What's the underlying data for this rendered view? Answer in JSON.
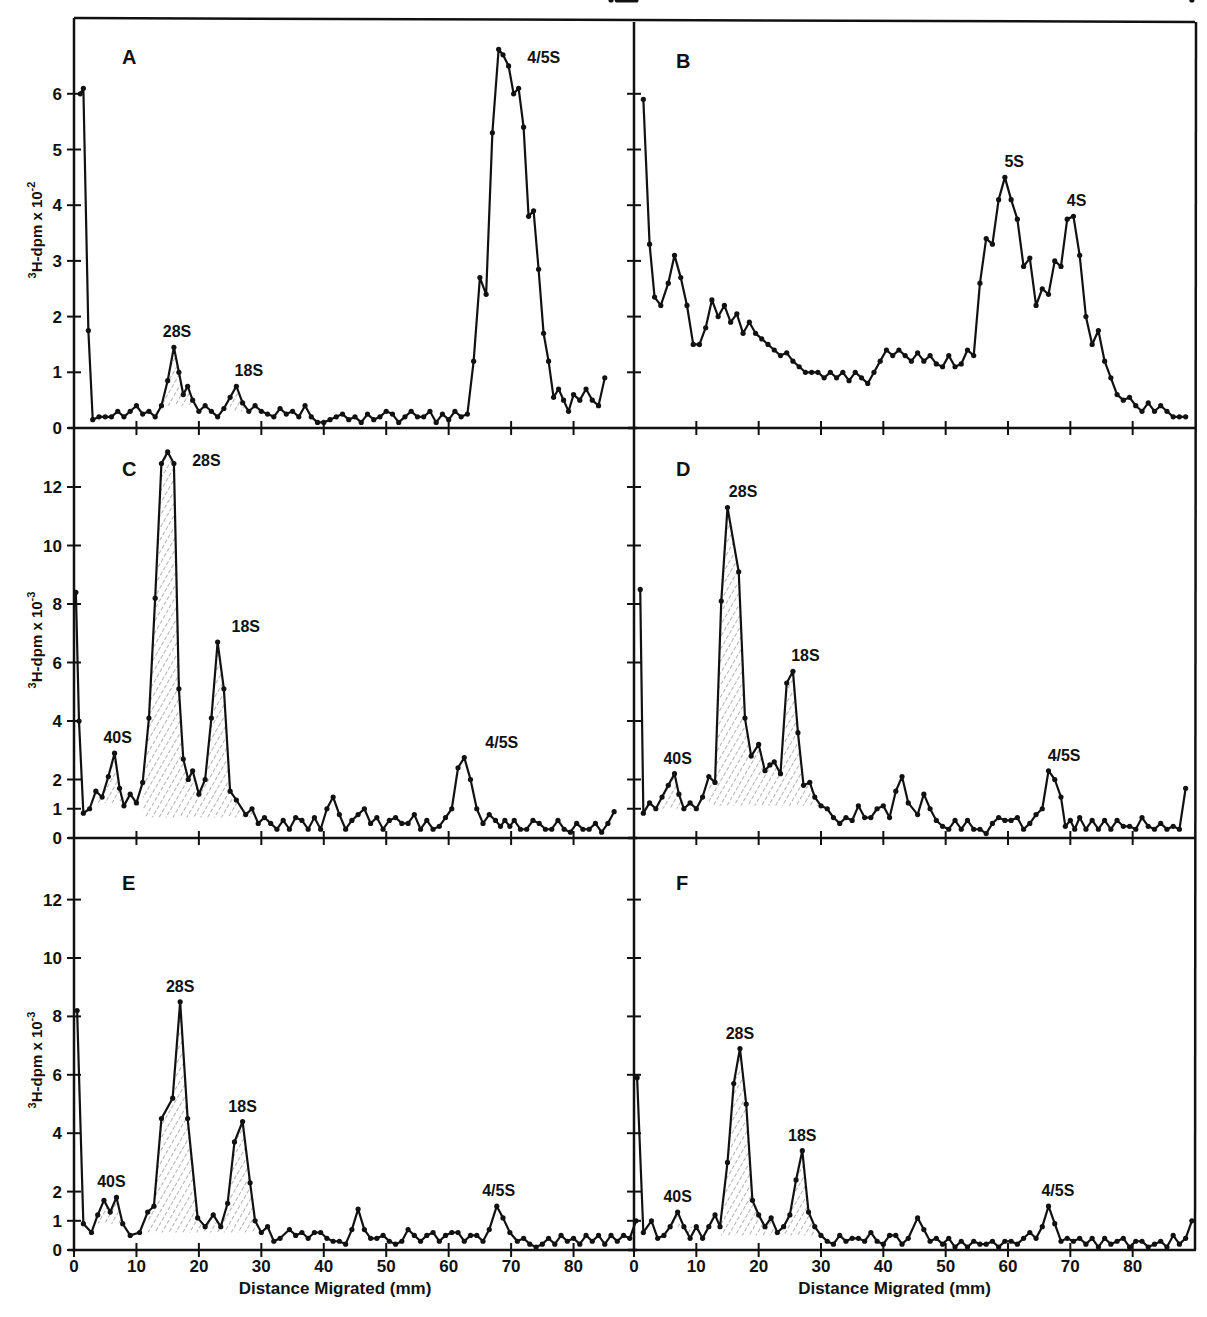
{
  "figure": {
    "x_axis_label": "Distance Migrated (mm)",
    "x_axis_label_right": "Distance Migrated (mm)",
    "y_axis_label_top": "3H-dpm x 10-2",
    "y_axis_label_mid": "3H-dpm x 10-3",
    "y_axis_label_bottom": "3H-dpm x 10-3",
    "x_ticks": [
      0,
      10,
      20,
      30,
      40,
      50,
      60,
      70,
      80
    ],
    "colors": {
      "line": "#111111",
      "hatch": "#555555",
      "background": "#ffffff"
    }
  },
  "chart_data": [
    {
      "panel": "A",
      "type": "line",
      "title": "A",
      "xlabel": "",
      "ylabel": "3H-dpm x 10^-2",
      "xlim": [
        0,
        90
      ],
      "ylim": [
        0,
        7
      ],
      "y_ticks": [
        0,
        1,
        2,
        3,
        4,
        5,
        6
      ],
      "annotations": [
        {
          "text": "28S",
          "x": 16.5,
          "y": 1.45
        },
        {
          "text": "18S",
          "x": 28,
          "y": 0.75
        },
        {
          "text": "4/5S",
          "x": 71,
          "y": 6.8
        }
      ],
      "shaded_peaks": [
        [
          14,
          21
        ],
        [
          25,
          30
        ]
      ],
      "x": [
        1,
        1.5,
        2.3,
        3,
        4,
        5,
        6,
        7,
        8,
        9,
        10,
        11,
        12,
        13,
        14,
        15,
        16,
        16.8,
        17.5,
        18.2,
        19,
        20,
        21,
        22,
        23,
        24,
        25,
        26,
        27,
        28,
        29,
        30,
        31,
        32,
        33,
        34,
        35,
        36,
        37,
        38,
        39,
        40,
        41,
        42,
        43,
        44,
        45,
        46,
        47,
        48,
        49,
        50,
        51,
        52,
        53,
        54,
        55,
        56,
        57,
        58,
        59,
        60,
        61,
        62,
        63,
        64,
        65,
        66,
        67,
        68,
        68.7,
        69.6,
        70.4,
        71.2,
        72,
        72.8,
        73.6,
        74.4,
        75.2,
        76,
        76.8,
        77.6,
        78.4,
        79.2,
        80,
        81,
        82,
        83,
        84,
        85,
        86,
        87,
        88,
        89,
        90
      ],
      "values": [
        6.0,
        6.1,
        1.75,
        0.15,
        0.2,
        0.2,
        0.2,
        0.3,
        0.2,
        0.3,
        0.4,
        0.25,
        0.3,
        0.2,
        0.4,
        0.85,
        1.45,
        1.0,
        0.6,
        0.75,
        0.5,
        0.3,
        0.4,
        0.3,
        0.2,
        0.35,
        0.55,
        0.75,
        0.45,
        0.3,
        0.4,
        0.3,
        0.25,
        0.2,
        0.35,
        0.25,
        0.3,
        0.2,
        0.4,
        0.2,
        0.1,
        0.1,
        0.15,
        0.2,
        0.25,
        0.15,
        0.2,
        0.1,
        0.25,
        0.15,
        0.2,
        0.3,
        0.25,
        0.1,
        0.2,
        0.3,
        0.2,
        0.2,
        0.3,
        0.1,
        0.25,
        0.15,
        0.3,
        0.2,
        0.25,
        1.2,
        2.7,
        2.4,
        5.3,
        6.8,
        6.7,
        6.5,
        6.0,
        6.1,
        5.4,
        3.8,
        3.9,
        2.85,
        1.7,
        1.2,
        0.55,
        0.7,
        0.5,
        0.3,
        0.6,
        0.5,
        0.7,
        0.5,
        0.4,
        0.9
      ],
      "x_note": "approximate readings"
    },
    {
      "panel": "B",
      "type": "line",
      "title": "B",
      "xlabel": "",
      "ylabel": "3H-dpm x 10^-2",
      "xlim": [
        0,
        90
      ],
      "ylim": [
        0,
        7
      ],
      "y_ticks": [
        0,
        1,
        2,
        3,
        4,
        5,
        6
      ],
      "annotations": [
        {
          "text": "5S",
          "x": 61,
          "y": 4.5
        },
        {
          "text": "4S",
          "x": 71,
          "y": 3.8
        }
      ],
      "shaded_peaks": [],
      "x": [
        1.5,
        2.5,
        3.3,
        4.3,
        5.5,
        6.5,
        7.5,
        8.5,
        9.5,
        10.5,
        11.5,
        12.5,
        13.5,
        14.5,
        15.5,
        16.5,
        17.5,
        18.5,
        19.5,
        20.5,
        21.5,
        22.5,
        23.5,
        24.5,
        25.5,
        26.5,
        27.5,
        28.5,
        29.5,
        30.5,
        31.5,
        32.5,
        33.5,
        34.5,
        35.5,
        36.5,
        37.5,
        38.5,
        39.5,
        40.5,
        41.5,
        42.5,
        43.5,
        44.5,
        45.5,
        46.5,
        47.5,
        48.5,
        49.5,
        50.5,
        51.5,
        52.5,
        53.5,
        54.5,
        55.5,
        56.5,
        57.5,
        58.5,
        59.5,
        60.5,
        61.5,
        62.5,
        63.5,
        64.5,
        65.5,
        66.5,
        67.5,
        68.5,
        69.5,
        70.5,
        71.5,
        72.5,
        73.5,
        74.5,
        75.5,
        76.5,
        77.5,
        78.5,
        79.5,
        80.5,
        81.5,
        82.5,
        83.5,
        84.5,
        85.5,
        86.5,
        87.5,
        88.5
      ],
      "values": [
        5.9,
        3.3,
        2.35,
        2.2,
        2.6,
        3.1,
        2.7,
        2.2,
        1.5,
        1.5,
        1.8,
        2.3,
        2.0,
        2.2,
        1.9,
        2.05,
        1.7,
        1.9,
        1.7,
        1.6,
        1.5,
        1.4,
        1.3,
        1.35,
        1.2,
        1.1,
        1.0,
        1.0,
        1.0,
        0.9,
        1.0,
        0.9,
        1.0,
        0.85,
        1.0,
        0.9,
        0.8,
        1.0,
        1.2,
        1.4,
        1.3,
        1.4,
        1.3,
        1.2,
        1.35,
        1.2,
        1.3,
        1.15,
        1.1,
        1.3,
        1.1,
        1.15,
        1.4,
        1.3,
        2.6,
        3.4,
        3.3,
        4.1,
        4.5,
        4.1,
        3.75,
        2.9,
        3.05,
        2.2,
        2.5,
        2.4,
        3.0,
        2.9,
        3.75,
        3.8,
        3.1,
        2.0,
        1.5,
        1.75,
        1.2,
        0.9,
        0.6,
        0.5,
        0.55,
        0.4,
        0.3,
        0.45,
        0.3,
        0.4,
        0.3,
        0.2,
        0.2,
        0.2
      ],
      "x_note": "approximate readings"
    },
    {
      "panel": "C",
      "type": "line",
      "title": "C",
      "xlabel": "",
      "ylabel": "3H-dpm x 10^-3",
      "xlim": [
        0,
        90
      ],
      "ylim": [
        0,
        13.5
      ],
      "y_ticks": [
        0,
        1,
        2,
        4,
        6,
        8,
        10,
        12
      ],
      "annotations": [
        {
          "text": "40S",
          "x": 7,
          "y": 2.9
        },
        {
          "text": "28S",
          "x": 17,
          "y": 13.2
        },
        {
          "text": "18S",
          "x": 27.5,
          "y": 6.7
        },
        {
          "text": "4/5S",
          "x": 68.5,
          "y": 2.75
        }
      ],
      "shaded_peaks": [
        [
          3.5,
          10
        ],
        [
          11,
          30.5
        ]
      ],
      "x": [
        0.3,
        0.8,
        1.5,
        2.5,
        3.5,
        4.5,
        5.5,
        6.5,
        7.3,
        8,
        9,
        10,
        11,
        12,
        13,
        14,
        15,
        16,
        16.8,
        17.5,
        18.3,
        19,
        20,
        21,
        22,
        23,
        24,
        25,
        26,
        27.5,
        28.5,
        29.5,
        30.5,
        31.5,
        32.5,
        33.5,
        34.5,
        35.5,
        36.5,
        37.5,
        38.5,
        39.5,
        40.5,
        41.5,
        42.5,
        43.5,
        44.5,
        45.5,
        46.5,
        47.5,
        48.5,
        49.5,
        50.5,
        51.5,
        52.5,
        53.5,
        54.5,
        55.5,
        56.5,
        57.5,
        58.5,
        59.5,
        60.5,
        61.5,
        62.5,
        63.5,
        64.5,
        65.5,
        66.5,
        67.5,
        68.3,
        69,
        69.8,
        70.5,
        71.5,
        72.5,
        73.5,
        74.5,
        75.5,
        76.5,
        77.5,
        78.5,
        79.5,
        80.5,
        81.5,
        82.5,
        83.5,
        84.5,
        85.5,
        86.5,
        87.5,
        88.5,
        89.5
      ],
      "values": [
        8.4,
        4.0,
        0.85,
        1.0,
        1.6,
        1.4,
        2.1,
        2.9,
        1.7,
        1.1,
        1.5,
        1.2,
        1.9,
        4.1,
        8.2,
        12.8,
        13.2,
        12.8,
        5.1,
        2.7,
        2.0,
        2.3,
        1.5,
        2.0,
        4.1,
        6.7,
        5.1,
        1.6,
        1.3,
        0.8,
        1.0,
        0.5,
        0.7,
        0.5,
        0.3,
        0.6,
        0.3,
        0.7,
        0.6,
        0.3,
        0.7,
        0.3,
        1.0,
        1.4,
        0.8,
        0.3,
        0.6,
        0.8,
        1.0,
        0.5,
        0.7,
        0.3,
        0.6,
        0.7,
        0.5,
        0.5,
        0.8,
        0.3,
        0.6,
        0.3,
        0.4,
        0.7,
        1.0,
        2.4,
        2.75,
        2.0,
        1.0,
        0.5,
        0.8,
        0.6,
        0.4,
        0.6,
        0.4,
        0.6,
        0.3,
        0.3,
        0.6,
        0.5,
        0.3,
        0.3,
        0.6,
        0.3,
        0.2,
        0.5,
        0.3,
        0.3,
        0.5,
        0.2,
        0.5,
        0.9
      ],
      "x_note": "approximate readings"
    },
    {
      "panel": "D",
      "type": "line",
      "title": "D",
      "xlabel": "",
      "ylabel": "3H-dpm x 10^-3",
      "xlim": [
        0,
        90
      ],
      "ylim": [
        0,
        13.5
      ],
      "y_ticks": [
        0,
        1,
        2,
        4,
        6,
        8,
        10,
        12
      ],
      "annotations": [
        {
          "text": "40S",
          "x": 7,
          "y": 2.2
        },
        {
          "text": "28S",
          "x": 17.5,
          "y": 11.3
        },
        {
          "text": "18S",
          "x": 27.5,
          "y": 5.7
        },
        {
          "text": "4/5S",
          "x": 69,
          "y": 2.3
        }
      ],
      "shaded_peaks": [
        [
          4,
          10
        ],
        [
          12,
          30
        ]
      ],
      "x": [
        1,
        1.5,
        2.5,
        3.5,
        4.5,
        5.5,
        6.5,
        7.2,
        8,
        9,
        10,
        11,
        12,
        13,
        14,
        15,
        16.8,
        17.8,
        18.8,
        20,
        21,
        21.8,
        22.5,
        23.5,
        24.5,
        25.5,
        26.3,
        27.2,
        28.2,
        29,
        30,
        31,
        32,
        33,
        34,
        35,
        36,
        37,
        38,
        39,
        40,
        41,
        42,
        43,
        44,
        45.5,
        46.5,
        47.5,
        48.5,
        49.5,
        50.5,
        51.5,
        52.5,
        53.5,
        54.5,
        55.5,
        56.5,
        57.5,
        58.5,
        59.5,
        60.5,
        61.5,
        62.5,
        63.5,
        64.5,
        65.5,
        66.5,
        67.5,
        68.5,
        69.2,
        70,
        70.7,
        71.5,
        72.5,
        73.5,
        74.5,
        75.5,
        76.5,
        77.5,
        78.5,
        79.5,
        80.5,
        81.5,
        82.5,
        83.5,
        84.5,
        85.5,
        86.5,
        87.5,
        88.5,
        89.5
      ],
      "values": [
        8.5,
        0.85,
        1.2,
        1.0,
        1.4,
        1.8,
        2.2,
        1.5,
        1.0,
        1.2,
        1.0,
        1.4,
        2.1,
        1.9,
        8.1,
        11.3,
        9.1,
        4.1,
        2.8,
        3.2,
        2.3,
        2.5,
        2.6,
        2.2,
        5.3,
        5.7,
        3.6,
        1.8,
        1.9,
        1.4,
        1.1,
        1.0,
        0.7,
        0.5,
        0.7,
        0.6,
        1.1,
        0.7,
        0.7,
        1.0,
        1.1,
        0.7,
        1.6,
        2.1,
        1.2,
        0.8,
        1.5,
        1.0,
        0.6,
        0.4,
        0.3,
        0.6,
        0.3,
        0.6,
        0.3,
        0.3,
        0.15,
        0.5,
        0.7,
        0.6,
        0.6,
        0.7,
        0.3,
        0.5,
        0.8,
        1.0,
        2.3,
        2.0,
        1.4,
        0.4,
        0.6,
        0.3,
        0.7,
        0.3,
        0.6,
        0.3,
        0.6,
        0.3,
        0.6,
        0.4,
        0.4,
        0.3,
        0.7,
        0.4,
        0.3,
        0.5,
        0.3,
        0.4,
        0.3,
        1.7
      ],
      "x_note": "approximate readings"
    },
    {
      "panel": "E",
      "type": "line",
      "title": "E",
      "xlabel": "Distance Migrated (mm)",
      "ylabel": "3H-dpm x 10^-3",
      "xlim": [
        0,
        90
      ],
      "ylim": [
        0,
        13.5
      ],
      "y_ticks": [
        0,
        1,
        2,
        4,
        6,
        8,
        10,
        12
      ],
      "annotations": [
        {
          "text": "40S",
          "x": 6,
          "y": 1.8
        },
        {
          "text": "28S",
          "x": 17,
          "y": 8.5
        },
        {
          "text": "18S",
          "x": 27,
          "y": 4.4
        },
        {
          "text": "4/5S",
          "x": 68,
          "y": 1.5
        }
      ],
      "shaded_peaks": [
        [
          3,
          8.5
        ],
        [
          11,
          30
        ]
      ],
      "x": [
        0.5,
        1.5,
        2.8,
        3.8,
        4.8,
        5.8,
        6.8,
        7.8,
        9,
        10.5,
        11.8,
        12.8,
        14,
        15.8,
        17,
        18.2,
        19.8,
        21,
        22.3,
        23.5,
        24.6,
        25.7,
        27,
        28.2,
        29,
        30,
        31,
        32,
        33,
        34.5,
        35.5,
        36.5,
        37.5,
        38.5,
        39.5,
        40.5,
        41.5,
        42.5,
        43.5,
        44.5,
        45.5,
        46.5,
        47.5,
        48.5,
        49.5,
        50.5,
        51.5,
        52.5,
        53.5,
        54.5,
        55.5,
        56.5,
        57.5,
        58.5,
        59.5,
        60.5,
        61.5,
        62.5,
        63.5,
        64.5,
        65.5,
        66.5,
        67.7,
        68.7,
        69.8,
        71,
        72,
        73,
        74,
        75,
        76,
        77,
        78,
        79,
        80,
        81,
        82,
        83,
        84,
        85,
        86,
        87,
        88,
        89,
        90
      ],
      "values": [
        8.2,
        0.9,
        0.6,
        1.2,
        1.7,
        1.3,
        1.8,
        0.9,
        0.5,
        0.6,
        1.3,
        1.5,
        4.5,
        5.2,
        8.5,
        4.5,
        1.1,
        0.8,
        1.2,
        0.8,
        1.6,
        3.7,
        4.4,
        2.3,
        1.0,
        0.6,
        0.8,
        0.3,
        0.4,
        0.7,
        0.5,
        0.6,
        0.4,
        0.6,
        0.6,
        0.4,
        0.3,
        0.3,
        0.2,
        0.7,
        1.4,
        0.7,
        0.4,
        0.4,
        0.5,
        0.3,
        0.2,
        0.3,
        0.7,
        0.5,
        0.3,
        0.5,
        0.6,
        0.3,
        0.5,
        0.6,
        0.6,
        0.3,
        0.5,
        0.5,
        0.3,
        0.7,
        1.5,
        1.1,
        0.6,
        0.3,
        0.4,
        0.2,
        0.1,
        0.2,
        0.4,
        0.2,
        0.5,
        0.3,
        0.4,
        0.2,
        0.5,
        0.3,
        0.5,
        0.2,
        0.5,
        0.3,
        0.5,
        0.4,
        1.0
      ],
      "x_note": "approximate readings"
    },
    {
      "panel": "F",
      "type": "line",
      "title": "F",
      "xlabel": "Distance Migrated (mm)",
      "ylabel": "3H-dpm x 10^-3",
      "xlim": [
        0,
        90
      ],
      "ylim": [
        0,
        13.5
      ],
      "y_ticks": [
        0,
        1,
        2,
        4,
        6,
        8,
        10,
        12
      ],
      "annotations": [
        {
          "text": "40S",
          "x": 7,
          "y": 1.3
        },
        {
          "text": "28S",
          "x": 17,
          "y": 6.9
        },
        {
          "text": "18S",
          "x": 27,
          "y": 3.4
        },
        {
          "text": "4/5S",
          "x": 68,
          "y": 1.5
        }
      ],
      "shaded_peaks": [
        [
          5,
          10
        ],
        [
          13.5,
          30
        ]
      ],
      "x": [
        0.5,
        1.5,
        2.8,
        3.8,
        4.8,
        5.8,
        7,
        8,
        9,
        10,
        11,
        12,
        13,
        13.8,
        15,
        16,
        17,
        18,
        19,
        20,
        21,
        22,
        23,
        24,
        25,
        26,
        27,
        28,
        29,
        30,
        31,
        32,
        33,
        34,
        35,
        36,
        37,
        38,
        39,
        40,
        41,
        42,
        43,
        44,
        45.5,
        46.5,
        47.5,
        48.5,
        49.5,
        50.5,
        51.5,
        52.5,
        53.5,
        54.5,
        55.5,
        56.5,
        57.5,
        58.5,
        59.5,
        60.5,
        61.5,
        62.5,
        63.5,
        64.5,
        65.5,
        66.5,
        67.5,
        68.5,
        69.5,
        70.5,
        71.5,
        72.5,
        73.5,
        74.5,
        75.5,
        76.5,
        77.5,
        78.5,
        79.5,
        80.5,
        81.5,
        82.5,
        83.5,
        84.5,
        85.5,
        86.5,
        87.5,
        88.5,
        89.5
      ],
      "values": [
        5.9,
        0.6,
        1.0,
        0.4,
        0.5,
        0.8,
        1.3,
        0.8,
        0.4,
        0.8,
        0.4,
        0.8,
        1.2,
        0.8,
        3.0,
        5.7,
        6.9,
        5.0,
        1.7,
        1.2,
        0.8,
        1.1,
        0.6,
        0.8,
        1.2,
        2.4,
        3.4,
        1.3,
        0.8,
        0.5,
        0.3,
        0.2,
        0.5,
        0.3,
        0.4,
        0.4,
        0.3,
        0.6,
        0.3,
        0.2,
        0.5,
        0.5,
        0.2,
        0.4,
        1.1,
        0.7,
        0.3,
        0.4,
        0.2,
        0.4,
        0.1,
        0.3,
        0.1,
        0.3,
        0.2,
        0.2,
        0.3,
        0.1,
        0.3,
        0.3,
        0.2,
        0.4,
        0.6,
        0.4,
        0.8,
        1.5,
        0.9,
        0.3,
        0.4,
        0.3,
        0.4,
        0.2,
        0.4,
        0.1,
        0.4,
        0.2,
        0.3,
        0.4,
        0.1,
        0.3,
        0.3,
        0.1,
        0.2,
        0.3,
        0.1,
        0.5,
        0.2,
        0.4,
        1.0
      ],
      "x_note": "approximate readings"
    }
  ]
}
